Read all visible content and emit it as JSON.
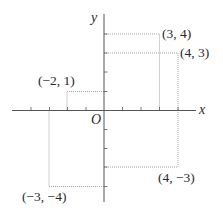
{
  "diagram": {
    "type": "coordinate-plane",
    "origin_label": "O",
    "x_axis_label": "x",
    "y_axis_label": "y",
    "x_range": [
      -5,
      4
    ],
    "y_range": [
      -5,
      5
    ],
    "colors": {
      "axis": "#555555",
      "guide": "#9a9a9a",
      "text": "#2a2a2a"
    },
    "points": [
      {
        "x": 3,
        "y": 4,
        "label": "(3, 4)"
      },
      {
        "x": 4,
        "y": 3,
        "label": "(4, 3)"
      },
      {
        "x": -2,
        "y": 1,
        "label": "(−2, 1)"
      },
      {
        "x": -3,
        "y": -4,
        "label": "(−3, −4)"
      },
      {
        "x": 4,
        "y": -3,
        "label": "(4, −3)"
      }
    ]
  }
}
